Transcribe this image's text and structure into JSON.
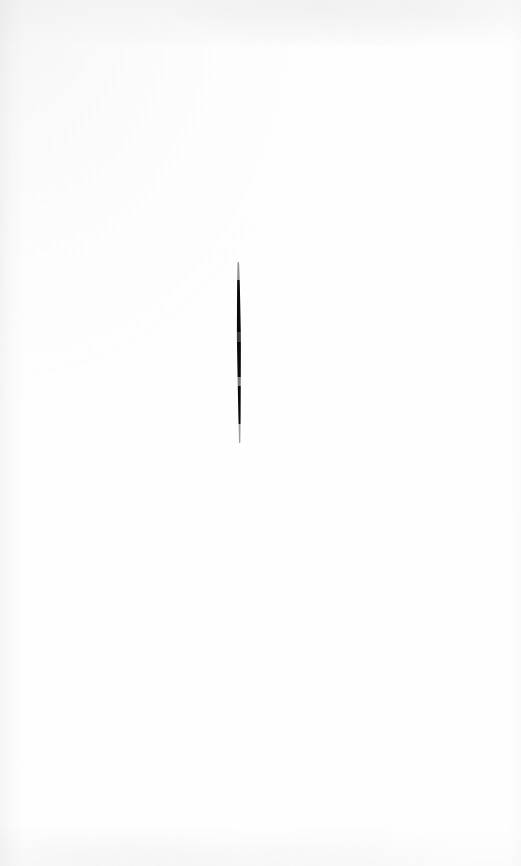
{
  "image": {
    "kind": "scanned-paper-scan",
    "width": 521,
    "height": 866,
    "background_color": "#fefefe",
    "has_text": false,
    "has_ui_chrome": false,
    "description": "Almost entirely blank off-white scanned page with a single short vertical ink stroke near the centre, slightly above the middle."
  },
  "paper": {
    "base_color": "#fefefe",
    "tone_color": "#8c8c8c",
    "edges_with_shading": [
      "top",
      "left",
      "bottom",
      "right"
    ]
  },
  "mark": {
    "name": "vertical ink stroke",
    "color": "#0a0a0a",
    "center_x": 239,
    "top_y": 262,
    "bottom_y": 443,
    "length_px": 181,
    "max_width_px": 4,
    "orientation": "vertical",
    "tapered_ends": true,
    "notch_positions_y": [
      335,
      381
    ],
    "segments": [
      {
        "label": "upper-taper",
        "from_y": 262,
        "to_y": 280,
        "opacity": 0.45
      },
      {
        "label": "upper-solid",
        "from_y": 280,
        "to_y": 332,
        "opacity": 1.0
      },
      {
        "label": "mid-notch",
        "from_y": 332,
        "to_y": 342,
        "opacity": 0.8
      },
      {
        "label": "mid-solid",
        "from_y": 342,
        "to_y": 377,
        "opacity": 1.0
      },
      {
        "label": "lower-gap",
        "from_y": 377,
        "to_y": 386,
        "opacity": 0.55
      },
      {
        "label": "lower-solid",
        "from_y": 386,
        "to_y": 424,
        "opacity": 1.0
      },
      {
        "label": "lower-taper",
        "from_y": 424,
        "to_y": 443,
        "opacity": 0.4
      }
    ]
  }
}
